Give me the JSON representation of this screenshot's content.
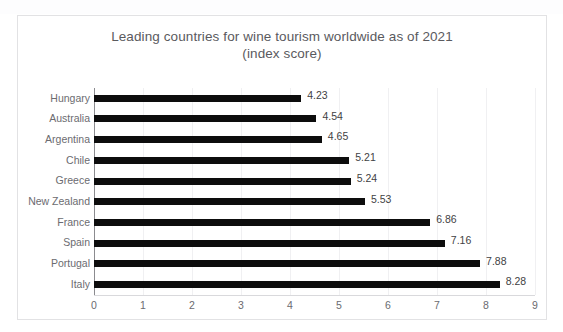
{
  "chart_data": {
    "type": "bar",
    "orientation": "horizontal",
    "title": "Leading countries for wine tourism worldwide as of 2021",
    "subtitle": "(index score)",
    "xlabel": "",
    "ylabel": "",
    "xlim": [
      0,
      9
    ],
    "xticks": [
      "0",
      "1",
      "2",
      "3",
      "4",
      "5",
      "6",
      "7",
      "8",
      "9"
    ],
    "grid": true,
    "legend": false,
    "bar_color": "#0d0d0d",
    "categories": [
      "Hungary",
      "Australia",
      "Argentina",
      "Chile",
      "Greece",
      "New Zealand",
      "France",
      "Spain",
      "Portugal",
      "Italy"
    ],
    "values": [
      4.23,
      4.54,
      4.65,
      5.21,
      5.24,
      5.53,
      6.86,
      7.16,
      7.88,
      8.28
    ],
    "data_labels": [
      "4.23",
      "4.54",
      "4.65",
      "5.21",
      "5.24",
      "5.53",
      "6.86",
      "7.16",
      "7.88",
      "8.28"
    ]
  }
}
